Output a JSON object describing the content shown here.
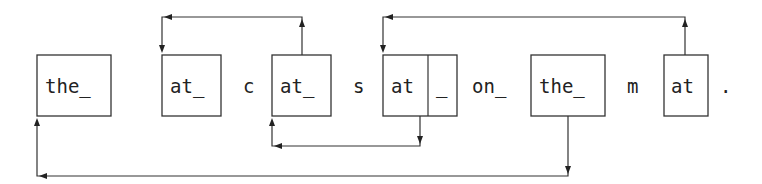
{
  "diagram": {
    "type": "lz77-backreference-parse",
    "tokens": [
      {
        "id": "t1",
        "text": "the_",
        "boxed": true
      },
      {
        "id": "t2",
        "text": "at_",
        "boxed": true
      },
      {
        "id": "t3",
        "text": "c",
        "boxed": false
      },
      {
        "id": "t4",
        "text": "at_",
        "boxed": true
      },
      {
        "id": "t5",
        "text": "s",
        "boxed": false
      },
      {
        "id": "t6a",
        "text": "at",
        "boxed": true
      },
      {
        "id": "t6b",
        "text": "_",
        "boxed": true
      },
      {
        "id": "t7",
        "text": "on_",
        "boxed": false
      },
      {
        "id": "t8",
        "text": "the_",
        "boxed": true
      },
      {
        "id": "t9",
        "text": "m",
        "boxed": false
      },
      {
        "id": "t10",
        "text": "at",
        "boxed": true
      },
      {
        "id": "t11",
        "text": ".",
        "boxed": false
      }
    ],
    "arrows": [
      {
        "from": "t4",
        "to": "t2",
        "route": "top"
      },
      {
        "from": "t10",
        "to": "t6a",
        "route": "top"
      },
      {
        "from": "t6b",
        "to": "t4",
        "route": "bottom"
      },
      {
        "from": "t8",
        "to": "t1",
        "route": "bottom"
      }
    ]
  }
}
